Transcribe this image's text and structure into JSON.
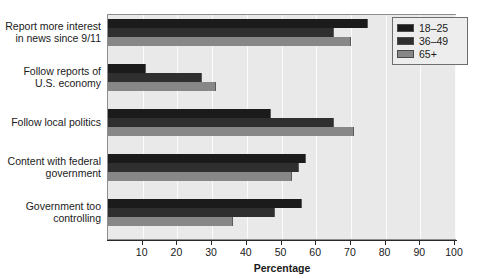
{
  "chart_data": {
    "type": "bar",
    "orientation": "horizontal",
    "title": "",
    "xlabel": "Percentage",
    "ylabel": "",
    "xlim": [
      0,
      100
    ],
    "xticks": [
      10,
      20,
      30,
      40,
      50,
      60,
      70,
      80,
      90,
      100
    ],
    "grid": true,
    "legend_position": "top-right",
    "categories": [
      "Report more interest in news since 9/11",
      "Follow reports of U.S. economy",
      "Follow local politics",
      "Content with federal government",
      "Government too controlling"
    ],
    "series": [
      {
        "name": "18–25",
        "color": "#1b1b1b",
        "values": [
          75,
          11,
          47,
          57,
          56
        ]
      },
      {
        "name": "36–49",
        "color": "#2f2f2f",
        "values": [
          65,
          27,
          65,
          55,
          48
        ]
      },
      {
        "name": "65+",
        "color": "#878787",
        "values": [
          70,
          31,
          71,
          53,
          36
        ]
      }
    ]
  },
  "axis": {
    "x_title": "Percentage",
    "x_tick_labels": [
      "10",
      "20",
      "30",
      "40",
      "50",
      "60",
      "70",
      "80",
      "90",
      "100"
    ],
    "category_labels": [
      {
        "line1": "Report more interest",
        "line2": "in news since 9/11"
      },
      {
        "line1": "Follow reports of",
        "line2": "U.S. economy"
      },
      {
        "line1": "Follow local politics",
        "line2": ""
      },
      {
        "line1": "Content with federal",
        "line2": "government"
      },
      {
        "line1": "Government too",
        "line2": "controlling"
      }
    ]
  },
  "legend": {
    "items": [
      {
        "label": "18–25",
        "color": "#1b1b1b"
      },
      {
        "label": "36–49",
        "color": "#2f2f2f"
      },
      {
        "label": "65+",
        "color": "#878787"
      }
    ]
  },
  "colors": {
    "plot_background": "#e9e9e9",
    "gridline": "#fbfbfb",
    "axis": "#2a2a2a",
    "series_18_25": "#1b1b1b",
    "series_36_49": "#2f2f2f",
    "series_65_plus": "#878787",
    "legend_background": "#ededed"
  }
}
